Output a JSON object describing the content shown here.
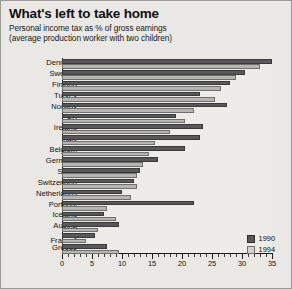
{
  "chart_data": {
    "type": "bar",
    "orientation": "horizontal",
    "title": "What's left to take home",
    "subtitle_line1": "Personal income tax as % of gross earnings",
    "subtitle_line2": "(average production worker with two children)",
    "xlabel": "",
    "ylabel": "",
    "xlim": [
      0,
      35
    ],
    "xticks": [
      0,
      5,
      10,
      15,
      20,
      25,
      30,
      35
    ],
    "xtick_labels": [
      "0",
      "5",
      "10",
      "15",
      "20",
      "25",
      "30",
      "35"
    ],
    "minor_tick_step": 1,
    "grid": false,
    "legend_position": "bottom-right",
    "categories": [
      "Denmark",
      "Sweden",
      "Finland",
      "Turkey",
      "Norway",
      "UK",
      "Ireland",
      "Italy",
      "Belgium",
      "Germany",
      "Spain",
      "Switzerland",
      "Netherlands",
      "Portugal",
      "Iceland",
      "Austria",
      "France",
      "Greece"
    ],
    "category_footnotes": {
      "France": "1"
    },
    "series": [
      {
        "name": "1990",
        "color": "#58585a",
        "values": [
          35.0,
          30.5,
          28.0,
          23.0,
          27.5,
          19.0,
          23.5,
          23.0,
          20.5,
          16.0,
          13.0,
          12.0,
          10.0,
          22.0,
          7.0,
          9.5,
          5.5,
          7.5
        ]
      },
      {
        "name": "1994",
        "color": "#b6b5b1",
        "values": [
          33.0,
          29.0,
          26.5,
          25.5,
          22.0,
          20.5,
          18.0,
          15.5,
          14.5,
          13.5,
          12.5,
          12.5,
          11.5,
          7.5,
          9.0,
          6.0,
          4.0,
          9.5
        ]
      }
    ]
  },
  "legend": {
    "items": [
      {
        "label": "1990",
        "key": "s1990"
      },
      {
        "label": "1994",
        "key": "s1994"
      }
    ]
  }
}
